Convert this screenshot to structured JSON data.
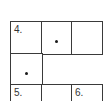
{
  "puzzle": {
    "rows": [
      {
        "cells": [
          {
            "number": "4.",
            "has_dot": false
          },
          {
            "number": "",
            "has_dot": true
          },
          {
            "number": "",
            "has_dot": false
          }
        ]
      },
      {
        "cells": [
          {
            "number": "",
            "has_dot": true
          }
        ]
      },
      {
        "cells": [
          {
            "number": "5.",
            "has_dot": false
          },
          {
            "number": "",
            "has_dot": false
          },
          {
            "number": "6.",
            "has_dot": false
          }
        ]
      }
    ],
    "colors": {
      "line": "#3a3a3a",
      "text": "#333333",
      "dot": "#1a1a1a",
      "background": "#ffffff"
    }
  }
}
